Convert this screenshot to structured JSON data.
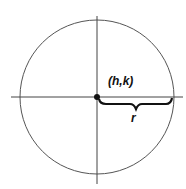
{
  "diagram": {
    "type": "circle-with-center-and-radius",
    "center_label": "(h,k)",
    "radius_label": "r",
    "colors": {
      "stroke": "#555555",
      "ink": "#111111",
      "background": "#ffffff"
    }
  }
}
